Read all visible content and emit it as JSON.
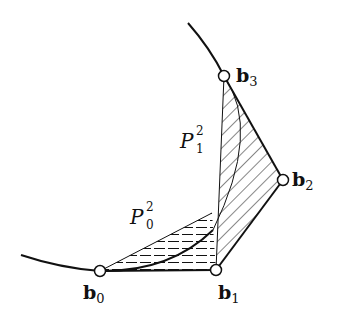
{
  "diagram": {
    "title": "",
    "points": [
      {
        "id": "b0",
        "label": "b",
        "sub": "0",
        "x": 100,
        "y": 271
      },
      {
        "id": "b1",
        "label": "b",
        "sub": "1",
        "x": 216,
        "y": 270
      },
      {
        "id": "b2",
        "label": "b",
        "sub": "2",
        "x": 283,
        "y": 180
      },
      {
        "id": "b3",
        "label": "b",
        "sub": "3",
        "x": 224,
        "y": 76
      }
    ],
    "regions": [
      {
        "id": "P0",
        "label": "P",
        "sub": "0",
        "sup": "2",
        "hatch": "horizontal"
      },
      {
        "id": "P1",
        "label": "P",
        "sub": "1",
        "sup": "2",
        "hatch": "diagonal"
      }
    ],
    "colors": {
      "stroke": "#111111",
      "background": "#ffffff",
      "point_fill": "#ffffff"
    }
  }
}
